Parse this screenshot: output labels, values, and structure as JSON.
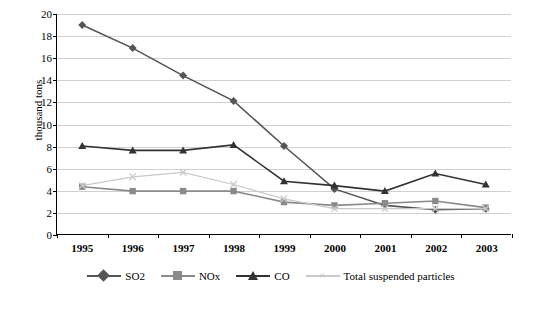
{
  "chart_data": {
    "type": "line",
    "title": "",
    "xlabel": "",
    "ylabel": "thousand tons",
    "categories": [
      "1995",
      "1996",
      "1997",
      "1998",
      "1999",
      "2000",
      "2001",
      "2002",
      "2003"
    ],
    "ylim": [
      0,
      20
    ],
    "yticks": [
      0,
      2,
      4,
      6,
      8,
      10,
      12,
      14,
      16,
      18,
      20
    ],
    "grid": "horizontal",
    "legend_position": "bottom",
    "series": [
      {
        "name": "SO2",
        "color": "#555555",
        "marker": "diamond",
        "values": [
          19.0,
          16.9,
          14.4,
          12.1,
          8.0,
          4.1,
          2.6,
          2.2,
          2.3
        ]
      },
      {
        "name": "NOx",
        "color": "#8a8a8a",
        "marker": "square",
        "values": [
          4.3,
          3.9,
          3.9,
          3.9,
          2.9,
          2.6,
          2.8,
          3.0,
          2.4
        ]
      },
      {
        "name": "CO",
        "color": "#333333",
        "marker": "triangle",
        "values": [
          8.0,
          7.6,
          7.6,
          8.1,
          4.8,
          4.4,
          3.9,
          5.5,
          4.5
        ]
      },
      {
        "name": "Total suspended particles",
        "color": "#c9c9c9",
        "marker": "x",
        "values": [
          4.4,
          5.2,
          5.6,
          4.5,
          3.2,
          2.3,
          2.3,
          2.3,
          2.3
        ]
      }
    ]
  },
  "legend": {
    "items": [
      {
        "label": "SO2"
      },
      {
        "label": "NOx"
      },
      {
        "label": "CO"
      },
      {
        "label": "Total suspended particles"
      }
    ]
  },
  "axis": {
    "y_title": "thousand tons"
  }
}
